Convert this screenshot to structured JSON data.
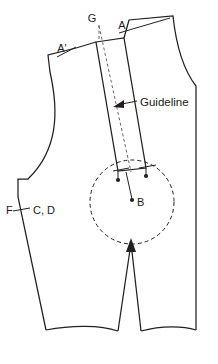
{
  "diagram": {
    "kind": "pattern-drafting-diagram",
    "background_color": "#ffffff",
    "line_color": "#231f20",
    "canvas": {
      "width": 218,
      "height": 364
    }
  },
  "labels": {
    "g": "G",
    "a": "A",
    "a_prime": "A'",
    "f": "F",
    "cd": "C, D",
    "b": "B",
    "guideline": "Guideline"
  },
  "annotations": [
    {
      "name": "point-g",
      "text": "G",
      "x": 92,
      "y": 21
    },
    {
      "name": "point-a",
      "text": "A",
      "x": 124,
      "y": 27
    },
    {
      "name": "point-a-prime",
      "text": "A'",
      "x": 62,
      "y": 50
    },
    {
      "name": "point-f",
      "text": "F",
      "x": 10,
      "y": 214
    },
    {
      "name": "points-c-d",
      "text": "C, D",
      "x": 33,
      "y": 214
    },
    {
      "name": "point-b",
      "text": "B",
      "x": 137,
      "y": 203
    },
    {
      "name": "guideline-callout",
      "text": "Guideline",
      "x": 140,
      "y": 105
    }
  ],
  "geometry": {
    "strip": {
      "name": "guideline-strip",
      "description": "narrow slanted rectangle representing the slash-and-spread guide strip",
      "corners": [
        [
          96,
          42
        ],
        [
          124,
          38
        ],
        [
          146,
          168
        ],
        [
          118,
          171
        ]
      ]
    },
    "strip_centerline": {
      "name": "strip-centerline",
      "style": "dashed",
      "from": [
        99,
        14
      ],
      "to": [
        131,
        170
      ]
    },
    "pivot_circle": {
      "name": "pivot-circle",
      "style": "dashed",
      "center_x": 132,
      "center_y": 202,
      "radius": 42
    },
    "pivot_point": {
      "name": "point-b-dot",
      "x": 132,
      "y": 202
    }
  }
}
